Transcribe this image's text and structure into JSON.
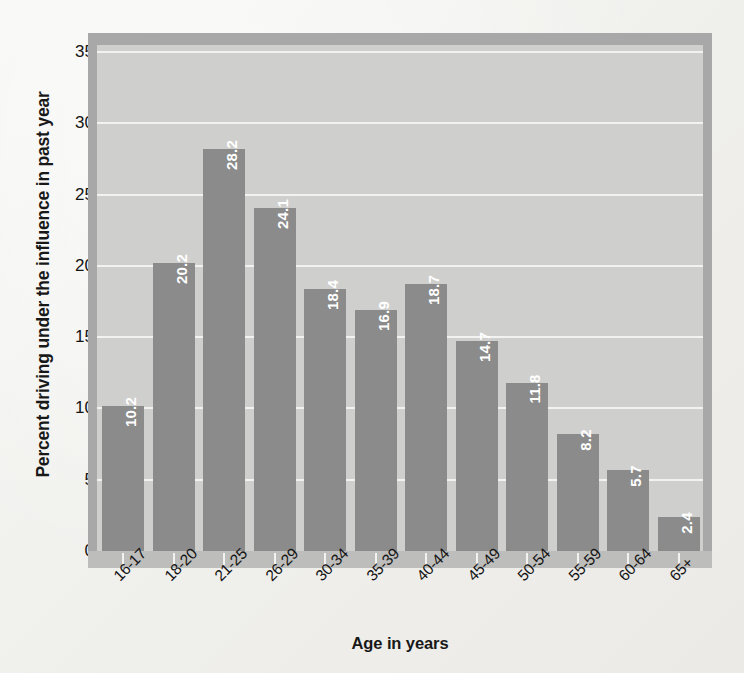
{
  "chart_data": {
    "type": "bar",
    "title": "",
    "xlabel": "Age in years",
    "ylabel": "Percent driving under the influence in past year",
    "categories": [
      "16-17",
      "18-20",
      "21-25",
      "26-29",
      "30-34",
      "35-39",
      "40-44",
      "45-49",
      "50-54",
      "55-59",
      "60-64",
      "65+"
    ],
    "values": [
      10.2,
      20.2,
      28.2,
      24.1,
      18.4,
      16.9,
      18.7,
      14.7,
      11.8,
      8.2,
      5.7,
      2.4
    ],
    "value_labels": [
      "10.2",
      "20.2",
      "28.2",
      "24.1",
      "18.4",
      "16.9",
      "18.7",
      "14.7",
      "11.8",
      "8.2",
      "5.7",
      "2.4"
    ],
    "ylim": [
      0,
      35.5
    ],
    "yticks": [
      0,
      5,
      10,
      15,
      20,
      25,
      30,
      35
    ],
    "ytick_labels": [
      "0",
      "5",
      "10",
      "15",
      "20",
      "25",
      "30",
      "35"
    ],
    "grid": true,
    "legend": false,
    "legend_position": "none",
    "series": [
      {
        "name": "Percent driving under the influence in past year",
        "values": [
          10.2,
          20.2,
          28.2,
          24.1,
          18.4,
          16.9,
          18.7,
          14.7,
          11.8,
          8.2,
          5.7,
          2.4
        ]
      }
    ],
    "colors": {
      "bar_fill": "#8b8b8b",
      "plot_background": "#cfcfce",
      "gridline": "#f2f2f0",
      "page_background": "#f1f1ef",
      "frame": "#a8a8a8",
      "value_label": "#ffffff",
      "axis_text": "#141414"
    }
  }
}
